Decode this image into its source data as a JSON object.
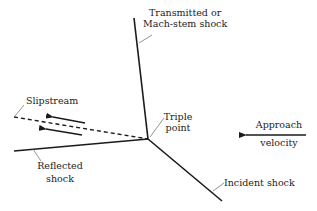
{
  "diagram": {
    "labels": {
      "transmitted_line1": "Transmitted or",
      "transmitted_line2": "Mach-stem shock",
      "slipstream": "Slipstream",
      "triple_line1": "Triple",
      "triple_line2": "point",
      "approach_line1": "Approach",
      "approach_line2": "velocity",
      "reflected_line1": "Reflected",
      "reflected_line2": "shock",
      "incident": "Incident shock"
    },
    "colors": {
      "line": "#1a1a1a",
      "leader": "#666666",
      "text": "#222222"
    }
  }
}
